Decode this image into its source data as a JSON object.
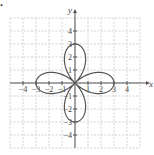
{
  "part_label": ".",
  "chart_data": {
    "type": "line",
    "title": "",
    "equation": "r = 3cos(2θ)",
    "curve": "four-petal rose",
    "xlabel": "x",
    "ylabel": "y",
    "xlim": [
      -5,
      5
    ],
    "ylim": [
      -5,
      5
    ],
    "grid": true,
    "x_ticks": [
      -4,
      -3,
      -2,
      -1,
      1,
      2,
      3,
      4
    ],
    "y_ticks": [
      -4,
      -3,
      -2,
      -1,
      1,
      2,
      3,
      4
    ],
    "x_tick_labels": [
      "−4",
      "−3",
      "−2",
      "−1",
      "1",
      "2",
      "3",
      "4"
    ],
    "y_tick_labels": [
      "−4",
      "−3",
      "−2",
      "−1",
      "1",
      "2",
      "3",
      "4"
    ],
    "petal_tips": [
      [
        3,
        0
      ],
      [
        0,
        3
      ],
      [
        -3,
        0
      ],
      [
        0,
        -3
      ]
    ],
    "series": [
      {
        "name": "rose",
        "color": "#555555"
      }
    ]
  },
  "colors": {
    "axis": "#555555",
    "grid": "#c8c8c8",
    "curve": "#555555",
    "text": "#444444"
  }
}
